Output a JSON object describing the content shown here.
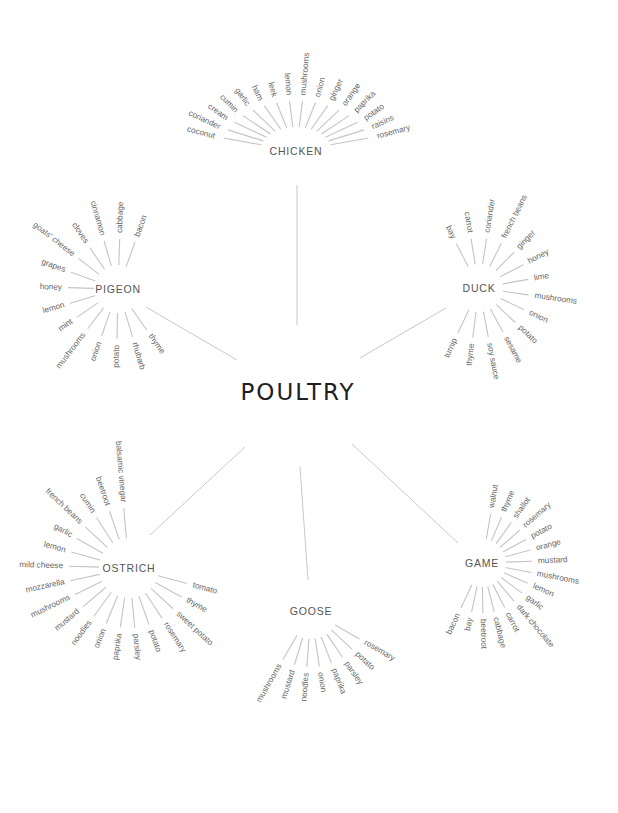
{
  "title": "POULTRY",
  "center": {
    "x": 298,
    "y": 392
  },
  "colors": {
    "title": "#1e1e1e",
    "hub": "#555555",
    "item": "#666666",
    "line": "#c4c4c4"
  },
  "hubs": [
    {
      "name": "CHICKEN",
      "x": 296,
      "y": 151,
      "connector": {
        "x1": 297,
        "y1": 185,
        "x2": 297,
        "y2": 325
      },
      "startAngle": 195,
      "endAngle": 345,
      "r1": 24,
      "r2": 50,
      "rl": 56,
      "items": [
        "coconut",
        "coriander",
        "cream",
        "cumin",
        "garlic",
        "ham",
        "leek",
        "lemon",
        "mushrooms",
        "onion",
        "ginger",
        "orange",
        "paprika",
        "potato",
        "raisins",
        "rosemary"
      ]
    },
    {
      "name": "DUCK",
      "x": 479,
      "y": 288,
      "connector": {
        "x1": 446,
        "y1": 308,
        "x2": 360,
        "y2": 358
      },
      "startAngle": 243,
      "endAngle": 475,
      "r1": 24,
      "r2": 50,
      "rl": 56,
      "items": [
        "bay",
        "carrot",
        "coriander",
        "french beans",
        "ginger",
        "honey",
        "lime",
        "mushrooms",
        "onion",
        "potato",
        "sesame",
        "soy sauce",
        "thyme",
        "turnip"
      ]
    },
    {
      "name": "PIGEON",
      "x": 118,
      "y": 289,
      "connector": {
        "x1": 146,
        "y1": 307,
        "x2": 237,
        "y2": 360
      },
      "startAngle": 290,
      "endAngle": 55,
      "r1": 24,
      "r2": 50,
      "rl": 56,
      "reverse": true,
      "items": [
        "bacon",
        "cabbage",
        "cinnamon",
        "cloves",
        "goats' cheese",
        "grapes",
        "honey",
        "lemon",
        "mint",
        "mushrooms",
        "onion",
        "potato",
        "rhubarb",
        "thyme"
      ]
    },
    {
      "name": "OSTRICH",
      "x": 129,
      "y": 568,
      "connector": {
        "x1": 150,
        "y1": 535,
        "x2": 245,
        "y2": 447
      },
      "startAngle": 85,
      "endAngle": 395,
      "r1": 30,
      "r2": 60,
      "rl": 66,
      "items": [
        "balsamic vinegar",
        "beetroot",
        "cumin",
        "french beans",
        "garlic",
        "lemon",
        "mild cheese",
        "mozzarella",
        "mushrooms",
        "mustard",
        "noodles",
        "onion",
        "paprika",
        "parsley",
        "potato",
        "rosemary",
        "sweet potato",
        "thyme",
        "tomato"
      ],
      "order": "ccw"
    },
    {
      "name": "GOOSE",
      "x": 311,
      "y": 611,
      "connector": {
        "x1": 300,
        "y1": 467,
        "x2": 308,
        "y2": 580
      },
      "startAngle": 120,
      "endAngle": 30,
      "r1": 28,
      "r2": 56,
      "rl": 62,
      "reverse": true,
      "items": [
        "mushrooms",
        "mustard",
        "noodles",
        "onion",
        "paprika",
        "parsley",
        "potato",
        "rosemary"
      ]
    },
    {
      "name": "GAME",
      "x": 482,
      "y": 563,
      "connector": {
        "x1": 352,
        "y1": 444,
        "x2": 458,
        "y2": 543
      },
      "startAngle": 280,
      "endAngle": 475,
      "r1": 24,
      "r2": 50,
      "rl": 56,
      "items": [
        "walnut",
        "thyme",
        "shallot",
        "rosemary",
        "potato",
        "orange",
        "mustard",
        "mushrooms",
        "lemon",
        "garlic",
        "dark chocolate",
        "carrot",
        "cabbage",
        "beetroot",
        "bay",
        "bacon"
      ]
    }
  ]
}
